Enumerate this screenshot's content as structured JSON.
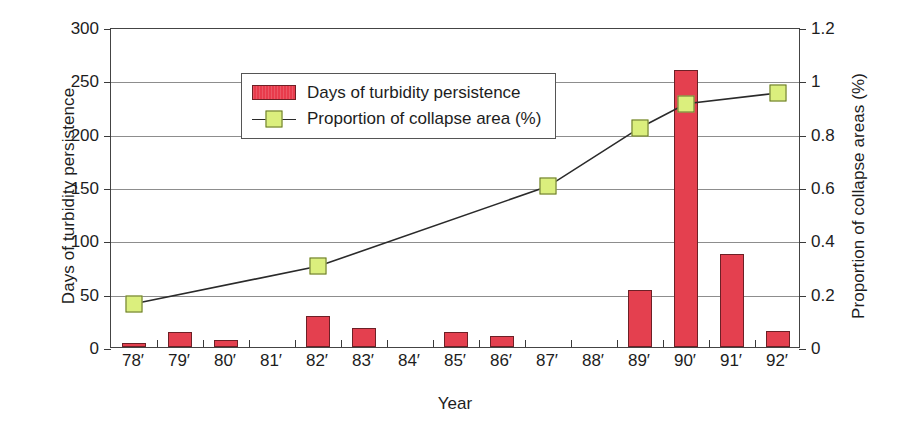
{
  "chart_data": {
    "type": "bar",
    "title": "",
    "xlabel": "Year",
    "categories": [
      "78′",
      "79′",
      "80′",
      "81′",
      "82′",
      "83′",
      "84′",
      "85′",
      "86′",
      "87′",
      "88′",
      "89′",
      "90′",
      "91′",
      "92′"
    ],
    "grid": true,
    "legend_position": "top-left",
    "axes": {
      "left": {
        "label": "Days of turbidity persistence",
        "ylim": [
          0,
          300
        ],
        "ticks": [
          0,
          50,
          100,
          150,
          200,
          250,
          300
        ],
        "tick_labels": [
          "0",
          "50",
          "100",
          "150",
          "200",
          "250",
          "300"
        ]
      },
      "right": {
        "label": "Proportion of collapse areas (%)",
        "ylim": [
          0,
          1.2
        ],
        "ticks": [
          0,
          0.2,
          0.4,
          0.6,
          0.8,
          1,
          1.2
        ],
        "tick_labels": [
          "0",
          "0.2",
          "0.4",
          "0.6",
          "0.8",
          "1",
          "1.2"
        ]
      }
    },
    "series": [
      {
        "name": "Days of turbidity persistence",
        "kind": "bar",
        "axis": "left",
        "color": "#e4404f",
        "edge_color": "#6d2026",
        "values": [
          4,
          14,
          7,
          0,
          29,
          18,
          0,
          14,
          10,
          0,
          0,
          53,
          260,
          87,
          15
        ]
      },
      {
        "name": "Proportion of collapse area (%)",
        "kind": "line",
        "axis": "right",
        "color": "#2a2a2a",
        "marker_color": "#dbef7d",
        "marker_edge_color": "#62702c",
        "x": [
          "78′",
          "82′",
          "87′",
          "89′",
          "90′",
          "92′"
        ],
        "values": [
          0.17,
          0.31,
          0.61,
          0.83,
          0.92,
          0.96
        ]
      }
    ]
  },
  "legend": {
    "entries": [
      {
        "label": "Days of turbidity persistence",
        "swatch": "bar-swatch"
      },
      {
        "label": "Proportion of collapse area (%)",
        "swatch": "line-marker-swatch"
      }
    ]
  },
  "colors": {
    "bar_fill": "#e4404f",
    "bar_edge": "#6d2026",
    "marker_fill": "#dbef7d",
    "marker_edge": "#62702c",
    "line": "#2a2a2a",
    "gridline": "#8d8d8d",
    "frame": "#444444",
    "background": "#ffffff"
  }
}
